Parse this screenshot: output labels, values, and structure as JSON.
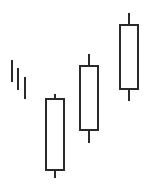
{
  "chart_data": {
    "type": "candlestick",
    "title": "",
    "xlabel": "",
    "ylabel": "",
    "grid": false,
    "legend": null,
    "style": {
      "stroke": "#2a2a2a",
      "body_fill": "#ffffff",
      "background": "#ffffff"
    },
    "pattern_note": "Three rising hollow (bullish) candles preceded by three short descending tick lines",
    "ticks": [
      {
        "x": 12,
        "top": 60,
        "bottom": 82
      },
      {
        "x": 18,
        "top": 68,
        "bottom": 90
      },
      {
        "x": 25,
        "top": 77,
        "bottom": 99
      }
    ],
    "candles": [
      {
        "index": 1,
        "direction": "up",
        "x_center": 55,
        "width": 18,
        "high_y": 94,
        "body_top_y": 99,
        "body_bottom_y": 170,
        "low_y": 178
      },
      {
        "index": 2,
        "direction": "up",
        "x_center": 89,
        "width": 18,
        "high_y": 54,
        "body_top_y": 66,
        "body_bottom_y": 130,
        "low_y": 143
      },
      {
        "index": 3,
        "direction": "up",
        "x_center": 129,
        "width": 18,
        "high_y": 13,
        "body_top_y": 25,
        "body_bottom_y": 89,
        "low_y": 101
      }
    ]
  }
}
